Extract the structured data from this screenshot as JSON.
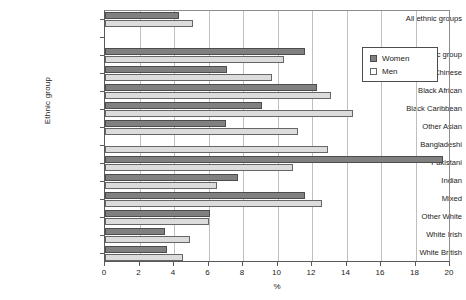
{
  "chart_data": {
    "type": "bar",
    "orientation": "horizontal",
    "title": "",
    "xlabel": "%",
    "ylabel": "Ethnic group",
    "xlim": [
      0,
      20
    ],
    "xticks": [
      0,
      2,
      4,
      6,
      8,
      10,
      12,
      14,
      16,
      18,
      20
    ],
    "grid": true,
    "legend_position": "top-right",
    "categories": [
      "All ethnic groups",
      "",
      "Other ethnic group",
      "Chinese",
      "Black African",
      "Black Caribbean",
      "Other Asian",
      "Bangladeshi",
      "Pakistani",
      "Indian",
      "Mixed",
      "Other White",
      "White Irish",
      "White British"
    ],
    "series": [
      {
        "name": "Women",
        "color": "#808080",
        "values": [
          4.3,
          null,
          11.6,
          7.1,
          12.3,
          9.1,
          7.0,
          0.0,
          19.6,
          7.7,
          11.6,
          6.1,
          3.5,
          3.6
        ]
      },
      {
        "name": "Men",
        "color": "#dcdcdc",
        "values": [
          5.1,
          null,
          10.4,
          9.7,
          13.1,
          14.4,
          11.2,
          12.9,
          10.9,
          6.5,
          12.6,
          6.0,
          4.9,
          4.5
        ]
      }
    ]
  },
  "legend": {
    "items": [
      {
        "label": "Women"
      },
      {
        "label": "Men"
      }
    ]
  },
  "axes": {
    "y_title": "Ethnic group",
    "x_title": "%"
  }
}
